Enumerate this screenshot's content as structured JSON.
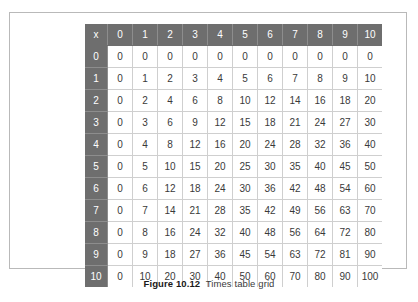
{
  "figure": {
    "caption_label": "Figure 10.12",
    "caption_text": "Times table grid"
  },
  "table": {
    "corner_label": "x",
    "column_headers": [
      "0",
      "1",
      "2",
      "3",
      "4",
      "5",
      "6",
      "7",
      "8",
      "9",
      "10"
    ],
    "row_headers": [
      "0",
      "1",
      "2",
      "3",
      "4",
      "5",
      "6",
      "7",
      "8",
      "9",
      "10"
    ],
    "rows": [
      [
        "0",
        "0",
        "0",
        "0",
        "0",
        "0",
        "0",
        "0",
        "0",
        "0",
        "0"
      ],
      [
        "0",
        "1",
        "2",
        "3",
        "4",
        "5",
        "6",
        "7",
        "8",
        "9",
        "10"
      ],
      [
        "0",
        "2",
        "4",
        "6",
        "8",
        "10",
        "12",
        "14",
        "16",
        "18",
        "20"
      ],
      [
        "0",
        "3",
        "6",
        "9",
        "12",
        "15",
        "18",
        "21",
        "24",
        "27",
        "30"
      ],
      [
        "0",
        "4",
        "8",
        "12",
        "16",
        "20",
        "24",
        "28",
        "32",
        "36",
        "40"
      ],
      [
        "0",
        "5",
        "10",
        "15",
        "20",
        "25",
        "30",
        "35",
        "40",
        "45",
        "50"
      ],
      [
        "0",
        "6",
        "12",
        "18",
        "24",
        "30",
        "36",
        "42",
        "48",
        "54",
        "60"
      ],
      [
        "0",
        "7",
        "14",
        "21",
        "28",
        "35",
        "42",
        "49",
        "56",
        "63",
        "70"
      ],
      [
        "0",
        "8",
        "16",
        "24",
        "32",
        "40",
        "48",
        "56",
        "64",
        "72",
        "80"
      ],
      [
        "0",
        "9",
        "18",
        "27",
        "36",
        "45",
        "54",
        "63",
        "72",
        "81",
        "90"
      ],
      [
        "0",
        "10",
        "20",
        "30",
        "40",
        "50",
        "60",
        "70",
        "80",
        "90",
        "100"
      ]
    ]
  },
  "colors": {
    "header_background": "#6e6e6e",
    "header_text": "#ffffff",
    "cell_text": "#3a3a3a",
    "grid_line": "#cfcfcf",
    "box_border": "#b9b9b9"
  }
}
